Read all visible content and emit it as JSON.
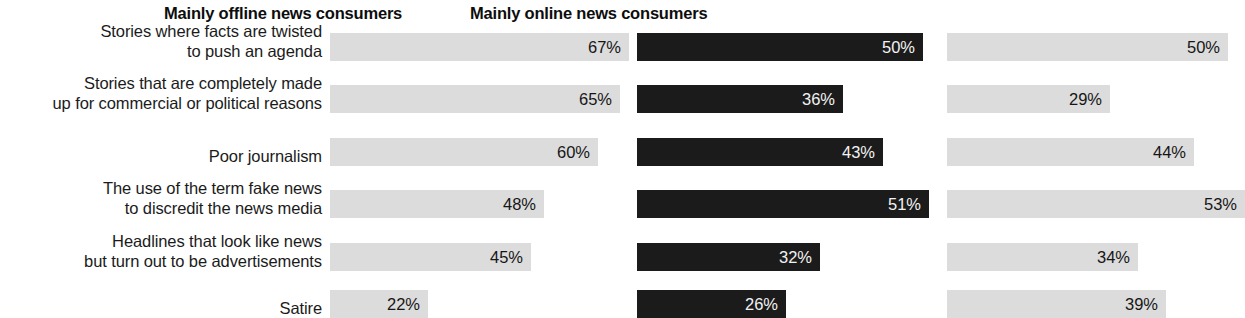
{
  "chart_data": {
    "type": "bar",
    "title": "",
    "subtitle": "",
    "xlabel": "",
    "ylabel": "",
    "orientation": "horizontal",
    "grid": false,
    "legend_position": "none",
    "value_suffix": "%",
    "categories": [
      "Stories where facts are twisted\nto push an agenda",
      "Stories that are completely made\nup for commercial or political reasons",
      "Poor journalism",
      "The use of the term fake news\nto discredit the news media",
      "Headlines that look like news\nbut turn out to be advertisements",
      "Satire"
    ],
    "series": [
      {
        "name": "All news consumers",
        "values": [
          67,
          65,
          60,
          48,
          45,
          22
        ],
        "value_labels": [
          "67%",
          "65%",
          "60%",
          "48%",
          "45%",
          "22%"
        ],
        "color": "#dcdcdc",
        "value_text_color": "#161616"
      },
      {
        "name": "Mainly offline news consumers",
        "values": [
          50,
          36,
          43,
          51,
          32,
          26
        ],
        "value_labels": [
          "50%",
          "36%",
          "43%",
          "51%",
          "32%",
          "26%"
        ],
        "color": "#1b1b1b",
        "value_text_color": "#f2f2f2"
      },
      {
        "name": "Mainly online news consumers",
        "values": [
          50,
          29,
          44,
          53,
          34,
          39
        ],
        "value_labels": [
          "50%",
          "29%",
          "44%",
          "53%",
          "34%",
          "39%"
        ],
        "color": "#dcdcdc",
        "value_text_color": "#161616"
      }
    ],
    "xlim": [
      0,
      70
    ]
  },
  "layout": {
    "columns": [
      {
        "left": 330,
        "px_per_point": 4.46,
        "header_center": 466
      },
      {
        "left": 637,
        "px_per_point": 5.72,
        "header_center": 786
      },
      {
        "left": 947,
        "px_per_point": 5.62,
        "header_center": 1092
      }
    ],
    "rows": [
      {
        "bar_top": 33,
        "label_top": 31
      },
      {
        "bar_top": 85,
        "label_top": 83
      },
      {
        "bar_top": 138,
        "label_top": 146
      },
      {
        "bar_top": 190,
        "label_top": 188
      },
      {
        "bar_top": 243,
        "label_top": 241
      },
      {
        "bar_top": 290,
        "label_top": 298
      }
    ],
    "bar_height": 28
  }
}
